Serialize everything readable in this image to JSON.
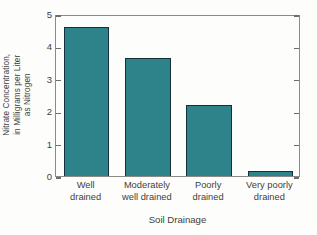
{
  "chart_data": {
    "type": "bar",
    "title": "",
    "xlabel": "Soil Drainage",
    "ylabel": "Nitrate Concentration, in Milligrams per Liter as Nitrogen",
    "ylabel_lines": [
      "Nitrate Concentration,",
      "in Milligrams per Liter",
      "as Nitrogen"
    ],
    "categories": [
      "Well drained",
      "Moderately well drained",
      "Poorly drained",
      "Very poorly drained"
    ],
    "category_lines": [
      [
        "Well",
        "drained"
      ],
      [
        "Moderately",
        "well drained"
      ],
      [
        "Poorly",
        "drained"
      ],
      [
        "Very poorly",
        "drained"
      ]
    ],
    "values": [
      4.6,
      3.65,
      2.18,
      0.15
    ],
    "ylim": [
      0,
      5
    ],
    "yticks": [
      0,
      1,
      2,
      3,
      4,
      5
    ],
    "ytick_labels": [
      "0",
      "1",
      "2",
      "3",
      "4",
      "5"
    ],
    "grid": false,
    "legend": false,
    "bar_color": "#2e8289",
    "bar_edge_color": "#14303a",
    "axis_color": "#8a8a87",
    "background_color": "#fdfdfb",
    "ticks_on_right_axis": true
  }
}
